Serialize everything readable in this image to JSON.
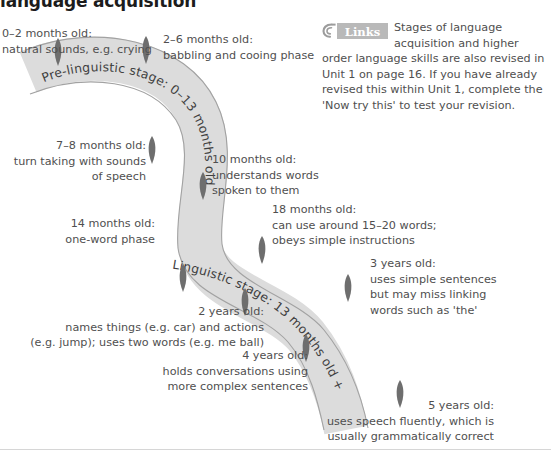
{
  "page": {
    "title": "language acquisition",
    "background_color": "#ffffff"
  },
  "colors": {
    "ribbon_fill": "#dcdcdc",
    "ribbon_stroke": "#9a9a9a",
    "arrow_fill": "#6e6e6e",
    "text": "#4f4f4f",
    "title_text": "#1c1c1c",
    "badge_fill": "#b9b9b9",
    "badge_text": "#ffffff"
  },
  "links_note": {
    "badge_label": "Links",
    "badge_icon": "chain-link-icon",
    "text": "Stages of language acquisition and higher order language skills are also revised in Unit 1 on page 16. If you have already revised this within Unit 1, complete the 'Now try this' to test your revision."
  },
  "ribbon_labels": [
    {
      "id": "pre-linguistic",
      "text": "Pre-linguistic stage: 0–13 months old"
    },
    {
      "id": "linguistic",
      "text": "Linguistic stage: 13 months old +"
    }
  ],
  "callouts": [
    {
      "id": "age-0-2-months",
      "align": "left",
      "lines": [
        "0–2 months old:",
        "natural sounds, e.g. crying"
      ]
    },
    {
      "id": "age-2-6-months",
      "align": "left",
      "lines": [
        "2–6 months old:",
        "babbling and cooing phase"
      ]
    },
    {
      "id": "age-7-8-months",
      "align": "right",
      "lines": [
        "7–8 months old:",
        "turn taking with sounds",
        "of speech"
      ]
    },
    {
      "id": "age-10-months",
      "align": "left",
      "lines": [
        "10 months old:",
        "understands words",
        "spoken to them"
      ]
    },
    {
      "id": "age-14-months",
      "align": "right",
      "lines": [
        "14 months old:",
        "one-word phase"
      ]
    },
    {
      "id": "age-18-months",
      "align": "left",
      "lines": [
        "18 months old:",
        "can use around 15–20 words;",
        "obeys simple instructions"
      ]
    },
    {
      "id": "age-3-years",
      "align": "left",
      "lines": [
        "3 years old:",
        "uses simple sentences",
        "but may miss linking",
        "words such as 'the'"
      ]
    },
    {
      "id": "age-2-years",
      "align": "right",
      "lines": [
        "2 years old:",
        "names things (e.g. car) and actions",
        "(e.g. jump); uses two words (e.g. me ball)"
      ]
    },
    {
      "id": "age-4-years",
      "align": "right",
      "lines": [
        "4 years old:",
        "holds conversations using",
        "more complex sentences"
      ]
    },
    {
      "id": "age-5-years",
      "align": "right",
      "lines": [
        "5 years old:",
        "uses speech fluently, which is",
        "usually grammatically correct"
      ]
    }
  ]
}
